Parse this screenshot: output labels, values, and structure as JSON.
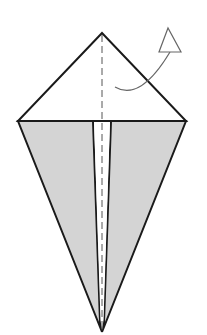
{
  "diagram": {
    "type": "origami-fold-step",
    "colors": {
      "background": "#ffffff",
      "outline": "#1a1a1a",
      "flap_fill": "#d4d4d4",
      "crease": "#555555",
      "arrow": "#666666"
    },
    "shapes": {
      "top_triangle": [
        [
          102,
          33
        ],
        [
          18,
          121
        ],
        [
          186,
          121
        ]
      ],
      "left_flap": [
        [
          18,
          121
        ],
        [
          93,
          121
        ],
        [
          99,
          318
        ],
        [
          102,
          332
        ]
      ],
      "right_flap": [
        [
          186,
          121
        ],
        [
          111,
          121
        ],
        [
          105,
          318
        ],
        [
          102,
          332
        ]
      ],
      "center_slit": [
        [
          93,
          121
        ],
        [
          111,
          121
        ],
        [
          105,
          318
        ],
        [
          102,
          332
        ],
        [
          99,
          318
        ]
      ],
      "centerline_crease": [
        [
          102,
          33
        ],
        [
          102,
          330
        ]
      ]
    },
    "arrow": {
      "meaning": "fold-behind / mountain-fold direction",
      "curve": "M115 87 Q138 100 170 52",
      "head": [
        [
          168,
          28
        ],
        [
          159,
          52
        ],
        [
          181,
          52
        ]
      ]
    }
  }
}
